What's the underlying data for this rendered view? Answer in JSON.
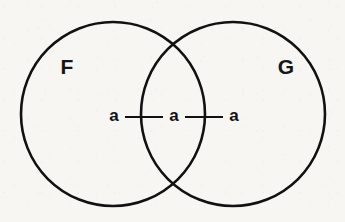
{
  "figure": {
    "kind": "venn-diagram",
    "title": "",
    "background_color": "#f7f6f3",
    "stroke_color": "#111111",
    "text_color": "#121212",
    "width": 345,
    "height": 222
  },
  "sets": [
    {
      "id": "F",
      "label": "F",
      "label_x": 67,
      "label_y": 68,
      "center_x": 113,
      "center_y": 114,
      "radius": 92,
      "stroke_width": 2.6
    },
    {
      "id": "G",
      "label": "G",
      "label_x": 286,
      "label_y": 68,
      "center_x": 233,
      "center_y": 114,
      "radius": 92,
      "stroke_width": 2.6
    }
  ],
  "elements": [
    {
      "id": "a-left",
      "label": "a",
      "x": 114,
      "y": 117,
      "region": "F-only"
    },
    {
      "id": "a-middle",
      "label": "a",
      "x": 174,
      "y": 117,
      "region": "F-and-G"
    },
    {
      "id": "a-right",
      "label": "a",
      "x": 234,
      "y": 117,
      "region": "G-only"
    }
  ],
  "connectors": [
    {
      "id": "connector-left",
      "x1": 125,
      "y1": 117,
      "x2": 163,
      "y2": 117,
      "stroke_width": 2.2
    },
    {
      "id": "connector-right",
      "x1": 185,
      "y1": 117,
      "x2": 223,
      "y2": 117,
      "stroke_width": 2.2
    }
  ],
  "intersections": [
    {
      "id": "intersection-top",
      "x": 173,
      "y": 38
    },
    {
      "id": "intersection-bottom",
      "x": 173,
      "y": 192
    }
  ]
}
